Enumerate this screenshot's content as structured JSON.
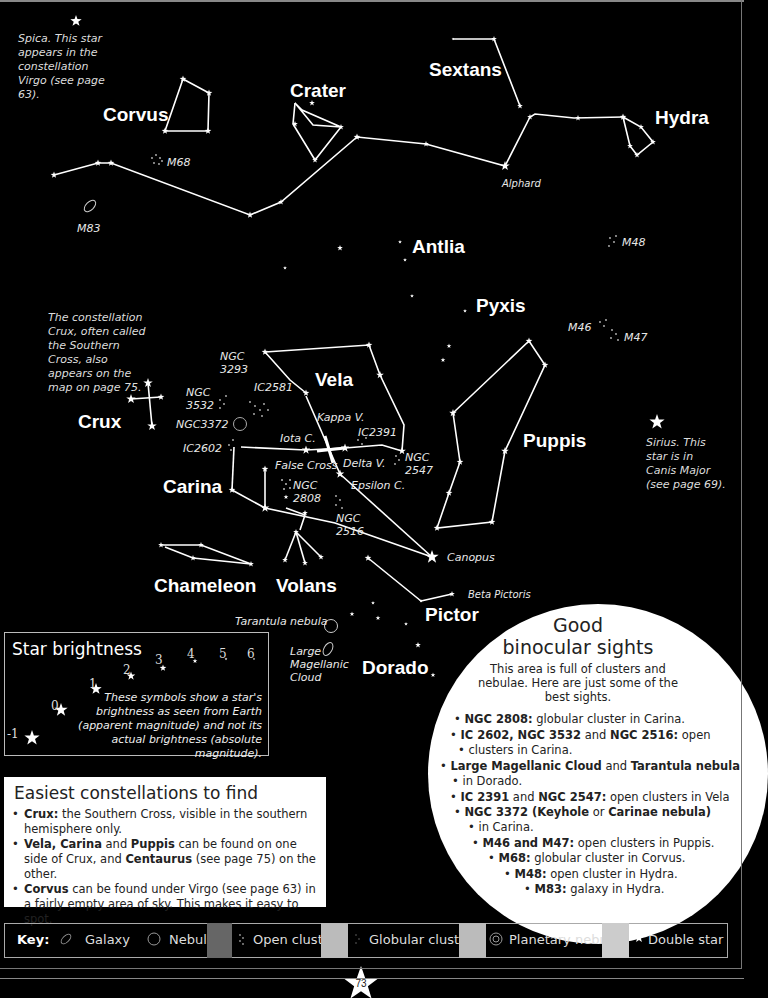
{
  "constellations": {
    "corvus": "Corvus",
    "crater": "Crater",
    "sextans": "Sextans",
    "hydra": "Hydra",
    "antlia": "Antlia",
    "pyxis": "Pyxis",
    "vela": "Vela",
    "crux": "Crux",
    "carina": "Carina",
    "puppis": "Puppis",
    "chameleon": "Chameleon",
    "volans": "Volans",
    "pictor": "Pictor",
    "dorado": "Dorado"
  },
  "objects": {
    "m68": "M68",
    "m83": "M83",
    "m48": "M48",
    "m46": "M46",
    "m47": "M47",
    "alphard": "Alphard",
    "ngc3293_a": "NGC",
    "ngc3293_b": "3293",
    "ic2581": "IC2581",
    "ngc3532_a": "NGC",
    "ngc3532_b": "3532",
    "ngc3372": "NGC3372",
    "ic2602": "IC2602",
    "kappa_v": "Kappa V.",
    "iota_c": "Iota C.",
    "ic2391": "IC2391",
    "delta_v": "Delta V.",
    "false_cross": "False Cross",
    "ngc2547_a": "NGC",
    "ngc2547_b": "2547",
    "ngc2808_a": "NGC",
    "ngc2808_b": "2808",
    "epsilon_c": "Epsilon C.",
    "ngc2516_a": "NGC",
    "ngc2516_b": "2516",
    "canopus": "Canopus",
    "beta_pictoris": "Beta Pictoris",
    "tarantula": "Tarantula nebula",
    "lmc_a": "Large",
    "lmc_b": "Magellanic",
    "lmc_c": "Cloud"
  },
  "notes": {
    "spica": "Spica. This star appears in the constellation Virgo (see page 63).",
    "crux": "The constellation Crux, often called the Southern Cross, also appears on the map on page 75.",
    "sirius": "Sirius. This star is in Canis Major (see page 69)."
  },
  "star_brightness": {
    "title": "Star brightness",
    "magnitudes": [
      "-1",
      "0",
      "1",
      "2",
      "3",
      "4",
      "5",
      "6"
    ],
    "description": "These symbols show a star's brightness as seen from Earth (apparent magnitude) and not its actual brightness (absolute magnitude)."
  },
  "easiest": {
    "title": "Easiest constellations to find",
    "items": [
      {
        "bold": "Crux:",
        "text": " the Southern Cross, visible in the southern hemisphere only."
      },
      {
        "bold": "Vela, Carina",
        "mid": " and ",
        "bold2": "Puppis",
        "mid2": " can be found on one side of Crux, and ",
        "bold3": "Centaurus",
        "text": " (see page 75) on the other."
      },
      {
        "bold": "Corvus",
        "text": " can be found under Virgo (see page 63) in a fairly empty area of sky. This makes it easy to spot."
      }
    ]
  },
  "binocular": {
    "title_line1": "Good",
    "title_line2": "binocular sights",
    "intro": "This area is full of clusters and nebulae. Here are just some of the best sights.",
    "items": [
      {
        "bold": "NGC 2808:",
        "text": " globular cluster in Carina."
      },
      {
        "bold": "IC 2602, NGC 3532",
        "mid": " and ",
        "bold2": "NGC 2516:",
        "text": " open"
      },
      {
        "text": "clusters in Carina."
      },
      {
        "bold": "Large Magellanic Cloud",
        "mid": " and ",
        "bold2": "Tarantula nebula",
        "text": ""
      },
      {
        "text": "in Dorado."
      },
      {
        "bold": "IC 2391",
        "mid": " and ",
        "bold2": "NGC 2547:",
        "text": " open clusters in Vela"
      },
      {
        "bold": "NGC 3372 (Keyhole",
        "mid": " or ",
        "bold2": "Carinae nebula)",
        "text": ""
      },
      {
        "text": "in Carina."
      },
      {
        "bold": "M46 and M47:",
        "text": " open clusters in Puppis."
      },
      {
        "bold": "M68:",
        "text": " globular cluster in Corvus."
      },
      {
        "bold": "M48:",
        "text": " open cluster in Hydra."
      },
      {
        "bold": "M83:",
        "text": " galaxy in Hydra."
      }
    ]
  },
  "key": {
    "label": "Key:",
    "items": [
      {
        "icon": "galaxy-icon",
        "label": "Galaxy"
      },
      {
        "icon": "nebula-icon",
        "label": "Nebula"
      },
      {
        "icon": "open-cluster-icon",
        "label": "Open cluste"
      },
      {
        "icon": "globular-cluster-icon",
        "label": "Globular cluste"
      },
      {
        "icon": "planetary-nebula-icon",
        "label": "Planetary nebula"
      },
      {
        "icon": "double-star-icon",
        "label": "Double star"
      }
    ]
  },
  "page_number": "73",
  "colors": {
    "background": "#000000",
    "lines": "#ffffff",
    "panel": "#ffffff",
    "key_gap_dark": "#666666",
    "key_gap_light": "#bbbbbb"
  }
}
